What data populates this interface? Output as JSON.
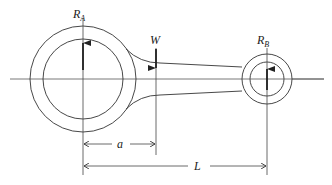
{
  "diagram": {
    "labels": {
      "reaction_a": "R",
      "reaction_a_sub": "A",
      "reaction_b": "R",
      "reaction_b_sub": "B",
      "load": "W",
      "dim_a": "a",
      "dim_L": "L"
    },
    "colors": {
      "line": "#333333",
      "arrow": "#222222",
      "background": "#ffffff"
    }
  }
}
